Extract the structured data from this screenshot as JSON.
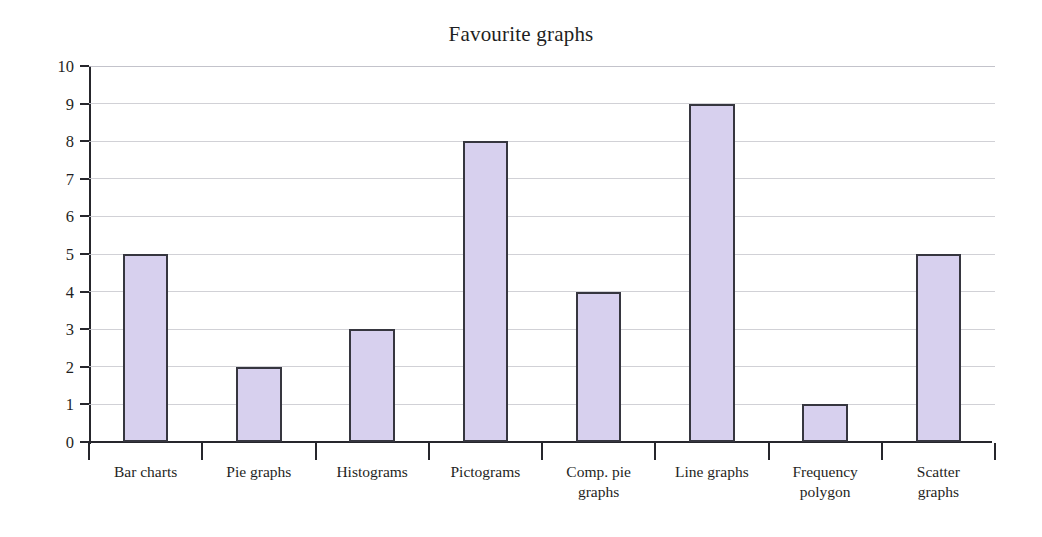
{
  "chart_data": {
    "type": "bar",
    "title": "Favourite graphs",
    "xlabel": "",
    "ylabel": "",
    "ylim": [
      0,
      10
    ],
    "ytick_step": 1,
    "grid": true,
    "legend": false,
    "bar_fill_color": "#d7d0ee",
    "bar_edge_color": "#36363f",
    "grid_color": "#c9c9cf",
    "axis_color": "#26262c",
    "categories": [
      "Bar charts",
      "Pie graphs",
      "Histograms",
      "Pictograms",
      "Comp. pie graphs",
      "Line graphs",
      "Frequency polygon",
      "Scatter graphs"
    ],
    "category_label_lines": [
      [
        "Bar charts"
      ],
      [
        "Pie graphs"
      ],
      [
        "Histograms"
      ],
      [
        "Pictograms"
      ],
      [
        "Comp. pie",
        "graphs"
      ],
      [
        "Line graphs"
      ],
      [
        "Frequency",
        "polygon"
      ],
      [
        "Scatter",
        "graphs"
      ]
    ],
    "values": [
      5,
      2,
      3,
      8,
      4,
      9,
      1,
      5
    ],
    "ytick_labels": [
      "10",
      "9",
      "8",
      "7",
      "6",
      "5",
      "4",
      "3",
      "2",
      "1",
      "0"
    ]
  }
}
